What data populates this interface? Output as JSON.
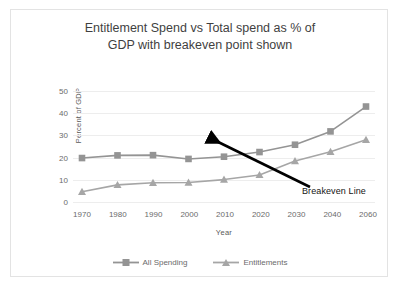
{
  "chart_data": {
    "type": "line",
    "title": "Entitlement Spend vs Total spend as % of GDP with breakeven point shown",
    "title_line1": "Entitlement Spend vs Total spend as % of",
    "title_line2": "GDP with breakeven point shown",
    "xlabel": "Year",
    "ylabel": "Percent of GDP",
    "categories": [
      "1970",
      "1980",
      "1990",
      "2000",
      "2010",
      "2020",
      "2030",
      "2040",
      "2060"
    ],
    "ylim": [
      0,
      50
    ],
    "yticks": [
      "0",
      "10",
      "20",
      "30",
      "40",
      "50"
    ],
    "grid": true,
    "legend_position": "bottom",
    "series": [
      {
        "name": "All Spending",
        "marker": "square",
        "color": "#949494",
        "values": [
          19.8,
          21.0,
          21.1,
          19.4,
          20.4,
          22.5,
          25.8,
          31.8,
          43.0
        ]
      },
      {
        "name": "Entitlements",
        "marker": "triangle",
        "color": "#a6a6a6",
        "values": [
          4.6,
          7.7,
          8.7,
          8.8,
          10.1,
          12.2,
          18.5,
          22.6,
          28.0
        ]
      }
    ],
    "annotations": [
      {
        "text": "Breakeven Line",
        "arrow_color": "#000000",
        "points_to_year": "2020"
      }
    ]
  }
}
